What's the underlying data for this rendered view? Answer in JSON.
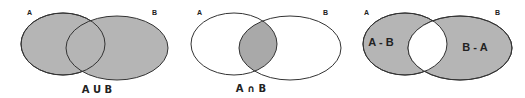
{
  "colors": {
    "fill": "#b5b5b5",
    "intersection_fill": "#a9a9a9",
    "stroke": "#333333",
    "background": "#ffffff"
  },
  "diagrams": [
    {
      "name": "union",
      "set_a_label": "A",
      "set_b_label": "B",
      "operation_label": "A U B"
    },
    {
      "name": "intersection",
      "set_a_label": "A",
      "set_b_label": "B",
      "operation_label": "A ∩ B"
    },
    {
      "name": "differences",
      "set_a_label": "A",
      "set_b_label": "B",
      "region_a_label": "A - B",
      "region_b_label": "B - A"
    }
  ]
}
